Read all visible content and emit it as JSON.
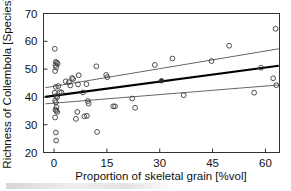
{
  "chart_data": {
    "type": "scatter",
    "title": "",
    "xlabel": "Proportion of skeletal grain [%vol]",
    "ylabel": "Richness of Collembola [Species]",
    "xlim": [
      -3,
      64
    ],
    "ylim": [
      20,
      70
    ],
    "xticks": [
      0,
      15,
      30,
      45,
      60
    ],
    "yticks": [
      20,
      30,
      40,
      50,
      60,
      70
    ],
    "xtick_labels": [
      "0",
      "15",
      "30",
      "45",
      "60"
    ],
    "ytick_labels": [
      "20",
      "30",
      "40",
      "50",
      "60",
      "70"
    ],
    "grid": false,
    "legend": "none",
    "marker": "open-circle",
    "marker_color": "#3a3a3a",
    "points": [
      [
        0.2,
        57.3
      ],
      [
        0.5,
        52.6
      ],
      [
        0.8,
        52.3
      ],
      [
        1.0,
        51.9
      ],
      [
        0.4,
        51.4
      ],
      [
        0.6,
        50.6
      ],
      [
        0.3,
        49.3
      ],
      [
        1.2,
        43.9
      ],
      [
        0.5,
        43.6
      ],
      [
        0.2,
        41.5
      ],
      [
        1.6,
        41.7
      ],
      [
        2.1,
        41.6
      ],
      [
        0.6,
        40.3
      ],
      [
        0.9,
        39.9
      ],
      [
        0.3,
        38.7
      ],
      [
        0.5,
        38.0
      ],
      [
        0.7,
        36.3
      ],
      [
        0.4,
        35.4
      ],
      [
        0.6,
        35.0
      ],
      [
        0.9,
        34.6
      ],
      [
        0.3,
        32.6
      ],
      [
        0.5,
        27.2
      ],
      [
        0.6,
        24.3
      ],
      [
        3.3,
        45.6
      ],
      [
        4.2,
        45.3
      ],
      [
        5.1,
        46.8
      ],
      [
        5.4,
        46.4
      ],
      [
        4.6,
        44.1
      ],
      [
        7.0,
        47.8
      ],
      [
        6.8,
        44.5
      ],
      [
        9.2,
        44.6
      ],
      [
        8.2,
        41.6
      ],
      [
        6.6,
        34.6
      ],
      [
        6.2,
        32.1
      ],
      [
        8.6,
        33.0
      ],
      [
        9.3,
        33.2
      ],
      [
        9.6,
        38.5
      ],
      [
        9.8,
        37.6
      ],
      [
        12.0,
        51.0
      ],
      [
        12.2,
        27.4
      ],
      [
        14.8,
        47.9
      ],
      [
        15.1,
        47.1
      ],
      [
        16.8,
        36.6
      ],
      [
        17.3,
        36.6
      ],
      [
        22.2,
        39.4
      ],
      [
        23.0,
        36.1
      ],
      [
        28.6,
        51.5
      ],
      [
        33.6,
        53.8
      ],
      [
        36.8,
        40.6
      ],
      [
        44.7,
        52.9
      ],
      [
        49.7,
        58.4
      ],
      [
        56.8,
        41.5
      ],
      [
        58.8,
        50.5
      ],
      [
        62.2,
        46.7
      ],
      [
        62.9,
        64.5
      ],
      [
        63.1,
        44.2
      ]
    ],
    "mean_point": {
      "x": 30.5,
      "y": 45.8,
      "marker": "filled-circle"
    },
    "regression_line": {
      "label": "fit",
      "color": "#000000",
      "x": [
        -2.5,
        63.8
      ],
      "y": [
        40.0,
        51.2
      ]
    },
    "confidence_bands": [
      {
        "label": "upper",
        "color": "#555555",
        "x": [
          -2.5,
          63.8
        ],
        "y": [
          43.3,
          57.3
        ]
      },
      {
        "label": "lower",
        "color": "#555555",
        "x": [
          -2.5,
          63.8
        ],
        "y": [
          37.5,
          44.3
        ]
      }
    ]
  }
}
